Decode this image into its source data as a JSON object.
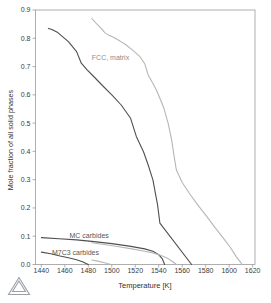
{
  "chart_data": {
    "type": "line",
    "title": "",
    "xlabel": "Temperature [K]",
    "ylabel": "Mole fraction of all solid phases",
    "xlim": [
      1435,
      1622
    ],
    "ylim": [
      0,
      0.9
    ],
    "x_ticks": [
      1440,
      1460,
      1480,
      1500,
      1520,
      1540,
      1560,
      1580,
      1600,
      1620
    ],
    "y_ticks": [
      0.0,
      0.1,
      0.2,
      0.3,
      0.4,
      0.5,
      0.6,
      0.7,
      0.8,
      0.9
    ],
    "grid": false,
    "legend": false,
    "frame_color": "#9b9b9b",
    "tick_label_color": "#3d3d3d",
    "axis_label_color": "#333333",
    "series": [
      {
        "id": "fcc-matrix-dark",
        "name": "FCC matrix (dark curve)",
        "color": "#4f4f4f",
        "points": [
          [
            1446,
            0.835
          ],
          [
            1449,
            0.831
          ],
          [
            1454,
            0.82
          ],
          [
            1463,
            0.788
          ],
          [
            1470,
            0.753
          ],
          [
            1474,
            0.712
          ],
          [
            1479,
            0.688
          ],
          [
            1485,
            0.663
          ],
          [
            1492,
            0.633
          ],
          [
            1500,
            0.6
          ],
          [
            1508,
            0.564
          ],
          [
            1516,
            0.517
          ],
          [
            1521,
            0.452
          ],
          [
            1527,
            0.399
          ],
          [
            1531,
            0.352
          ],
          [
            1535,
            0.299
          ],
          [
            1539,
            0.21
          ],
          [
            1541,
            0.146
          ],
          [
            1568,
            0.0
          ]
        ]
      },
      {
        "id": "fcc-matrix-light",
        "name": "FCC matrix (gray curve)",
        "color": "#b6b6b6",
        "points": [
          [
            1483,
            0.87
          ],
          [
            1487,
            0.852
          ],
          [
            1491,
            0.835
          ],
          [
            1494,
            0.82
          ],
          [
            1497,
            0.812
          ],
          [
            1501,
            0.804
          ],
          [
            1507,
            0.79
          ],
          [
            1512,
            0.777
          ],
          [
            1518,
            0.757
          ],
          [
            1524,
            0.735
          ],
          [
            1528,
            0.71
          ],
          [
            1531,
            0.67
          ],
          [
            1535,
            0.64
          ],
          [
            1538,
            0.617
          ],
          [
            1544,
            0.558
          ],
          [
            1548,
            0.5
          ],
          [
            1551,
            0.44
          ],
          [
            1553,
            0.385
          ],
          [
            1555,
            0.334
          ],
          [
            1560,
            0.29
          ],
          [
            1566,
            0.252
          ],
          [
            1573,
            0.212
          ],
          [
            1581,
            0.169
          ],
          [
            1588,
            0.13
          ],
          [
            1595,
            0.093
          ],
          [
            1601,
            0.06
          ],
          [
            1606,
            0.028
          ],
          [
            1609,
            0.012
          ],
          [
            1611,
            0.0
          ]
        ]
      },
      {
        "id": "mc-carbides-dark",
        "name": "MC carbides (dark curve)",
        "color": "#4f4f4f",
        "points": [
          [
            1440,
            0.095
          ],
          [
            1455,
            0.091
          ],
          [
            1470,
            0.087
          ],
          [
            1485,
            0.081
          ],
          [
            1500,
            0.074
          ],
          [
            1515,
            0.065
          ],
          [
            1528,
            0.055
          ],
          [
            1535,
            0.047
          ],
          [
            1540,
            0.035
          ],
          [
            1543,
            0.02
          ],
          [
            1545,
            0.0
          ]
        ]
      },
      {
        "id": "mc-carbides-light",
        "name": "MC carbides (gray curve)",
        "color": "#b6b6b6",
        "points": [
          [
            1483,
            0.077
          ],
          [
            1495,
            0.07
          ],
          [
            1506,
            0.063
          ],
          [
            1517,
            0.055
          ],
          [
            1528,
            0.047
          ],
          [
            1535,
            0.041
          ],
          [
            1542,
            0.032
          ],
          [
            1548,
            0.021
          ],
          [
            1552,
            0.01
          ],
          [
            1555,
            0.0
          ]
        ]
      },
      {
        "id": "m7c3-carbides-dark",
        "name": "M7C3 carbides (dark curve)",
        "color": "#4f4f4f",
        "points": [
          [
            1440,
            0.044
          ],
          [
            1448,
            0.038
          ],
          [
            1456,
            0.03
          ],
          [
            1464,
            0.023
          ],
          [
            1470,
            0.017
          ],
          [
            1475,
            0.01
          ],
          [
            1478,
            0.004
          ],
          [
            1480,
            0.0
          ]
        ]
      },
      {
        "id": "m7c3-carbides-light",
        "name": "M7C3 carbides (gray curve)",
        "color": "#b6b6b6",
        "points": [
          [
            1483,
            0.016
          ],
          [
            1488,
            0.012
          ],
          [
            1493,
            0.007
          ],
          [
            1497,
            0.003
          ],
          [
            1499,
            0.0
          ]
        ]
      }
    ],
    "annotations": [
      {
        "id": "fcc-matrix",
        "text": "FCC, matrix",
        "x": 1483,
        "y": 0.732,
        "color": "#8c8c8c"
      },
      {
        "id": "mc-carbides",
        "text": "MC carbides",
        "x": 1464,
        "y": 0.103,
        "color": "#555555"
      },
      {
        "id": "m7c3-carbides",
        "text": "M7C3 carbides",
        "x": 1449,
        "y": 0.041,
        "color": "#555555"
      }
    ]
  },
  "logo": {
    "name": "thermo-calc-triangle",
    "color": "#9aa0a6"
  }
}
